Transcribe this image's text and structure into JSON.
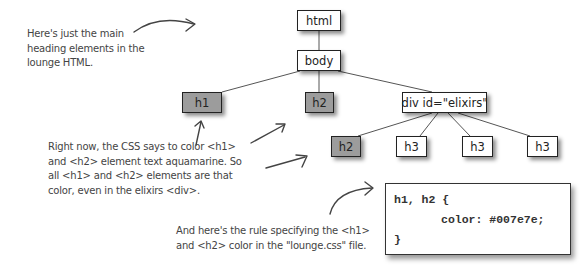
{
  "tree": {
    "nodes": {
      "html": "html",
      "body": "body",
      "h1": "h1",
      "h2_top": "h2",
      "div": "div id=\"elixirs\"",
      "h2_child": "h2",
      "h3_a": "h3",
      "h3_b": "h3",
      "h3_c": "h3"
    },
    "highlighted": [
      "h1",
      "h2_top",
      "h2_child"
    ],
    "highlight_color": "#9c9c9c"
  },
  "annotations": {
    "intro": [
      "Here's just the main",
      "heading elements in the",
      "lounge HTML."
    ],
    "css_explanation": [
      "Right now, the CSS says to color <h1>",
      "and <h2> element text aquamarine. So",
      "all <h1> and <h2> elements are that",
      "color, even in the elixirs <div>."
    ],
    "rule_note": [
      "And here's the rule specifying the <h1>",
      "and <h2> color in the \"lounge.css\" file."
    ]
  },
  "code": {
    "line1": "h1, h2 {",
    "line2": "color: #007e7e;",
    "line3": "}"
  }
}
